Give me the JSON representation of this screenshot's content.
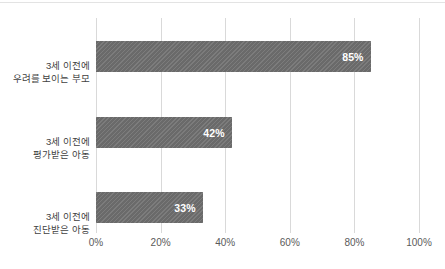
{
  "chart_data": {
    "type": "bar",
    "orientation": "horizontal",
    "title": "",
    "subtitle": "",
    "xlabel": "",
    "ylabel": "",
    "categories": [
      "3세 이전에 우려를 보이는 부모",
      "3세 이전에 평가받은 아동",
      "3세 이전에 진단받은 아동"
    ],
    "category_lines": [
      [
        "3세 이전에",
        "우려를 보이는 부모"
      ],
      [
        "3세 이전에",
        "평가받은 아동"
      ],
      [
        "3세 이전에",
        "진단받은 아동"
      ]
    ],
    "values": [
      85,
      42,
      33
    ],
    "data_labels": [
      "85%",
      "42%",
      "33%"
    ],
    "xlim": [
      0,
      100
    ],
    "xticks": [
      0,
      20,
      40,
      60,
      80,
      100
    ],
    "xtick_labels": [
      "0%",
      "20%",
      "40%",
      "60%",
      "80%",
      "100%"
    ],
    "grid": true,
    "grid_axis": "x",
    "legend": false,
    "legend_position": "none",
    "bar_color": "#707070",
    "bar_pattern": "diagonal-hatch",
    "data_label_color": "#ffffff",
    "gridline_color": "#d9d9d9",
    "axis_text_color": "#5a5a5a",
    "category_text_color": "#3f3f3f",
    "background_color": "#ffffff"
  }
}
